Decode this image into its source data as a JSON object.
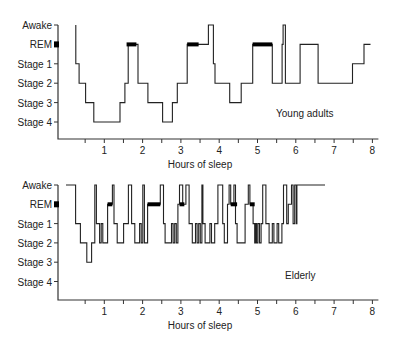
{
  "chart_data": [
    {
      "type": "line",
      "title": "Young adults",
      "xlabel": "Hours of sleep",
      "ylabel": "",
      "y_categories": [
        "Awake",
        "REM",
        "Stage 1",
        "Stage 2",
        "Stage 3",
        "Stage 4"
      ],
      "x_ticks": [
        1,
        2,
        3,
        4,
        5,
        6,
        7,
        8
      ],
      "xlim": [
        0,
        8
      ],
      "steps": [
        [
          0.0,
          0
        ],
        [
          0.3,
          0
        ],
        [
          0.3,
          2
        ],
        [
          0.4,
          2
        ],
        [
          0.4,
          3
        ],
        [
          0.6,
          3
        ],
        [
          0.6,
          4
        ],
        [
          0.85,
          4
        ],
        [
          0.85,
          5
        ],
        [
          1.6,
          5
        ],
        [
          1.6,
          4
        ],
        [
          1.75,
          4
        ],
        [
          1.75,
          3
        ],
        [
          1.8,
          3
        ],
        [
          1.8,
          1
        ],
        [
          2.05,
          1
        ],
        [
          2.05,
          3
        ],
        [
          2.35,
          3
        ],
        [
          2.35,
          4
        ],
        [
          2.9,
          4
        ],
        [
          2.9,
          5
        ],
        [
          2.9,
          5
        ],
        [
          2.9,
          5
        ],
        [
          3.1,
          5
        ]
      ],
      "segments_young": true
    },
    {
      "type": "line",
      "title": "Elderly",
      "xlabel": "Hours of sleep",
      "y_categories": [
        "Awake",
        "REM",
        "Stage 1",
        "Stage 2",
        "Stage 3",
        "Stage 4"
      ],
      "x_ticks": [
        1,
        2,
        3,
        4,
        5,
        6,
        7,
        8
      ],
      "xlim": [
        0,
        8
      ]
    }
  ],
  "young": {
    "label": "Young adults",
    "xlabel": "Hours of sleep",
    "ticks": [
      "1",
      "2",
      "3",
      "4",
      "5",
      "6",
      "7",
      "8"
    ],
    "y_labels": [
      "Awake",
      "REM",
      "Stage 1",
      "Stage 2",
      "Stage 3",
      "Stage 4"
    ],
    "steps": [
      [
        0.3,
        0
      ],
      [
        0.3,
        2
      ],
      [
        0.4,
        2
      ],
      [
        0.4,
        3
      ],
      [
        0.6,
        3
      ],
      [
        0.6,
        4
      ],
      [
        0.85,
        4
      ],
      [
        0.85,
        5
      ],
      [
        1.65,
        5
      ],
      [
        1.65,
        4
      ],
      [
        1.8,
        4
      ],
      [
        1.8,
        3
      ],
      [
        1.9,
        3
      ],
      [
        1.9,
        1
      ],
      [
        2.2,
        1
      ],
      [
        2.2,
        3
      ],
      [
        2.5,
        3
      ],
      [
        2.5,
        4
      ],
      [
        2.95,
        4
      ],
      [
        2.95,
        5
      ],
      [
        3.25,
        5
      ],
      [
        3.25,
        4
      ],
      [
        3.4,
        4
      ],
      [
        3.4,
        3
      ],
      [
        3.7,
        3
      ],
      [
        3.7,
        1
      ],
      [
        4.35,
        1
      ],
      [
        4.35,
        0
      ],
      [
        4.5,
        0
      ],
      [
        4.5,
        2
      ],
      [
        4.55,
        2
      ],
      [
        4.55,
        3
      ],
      [
        5.0,
        3
      ],
      [
        5.0,
        4
      ],
      [
        5.35,
        4
      ],
      [
        5.35,
        3
      ],
      [
        5.7,
        3
      ],
      [
        5.7,
        1
      ],
      [
        6.3,
        1
      ],
      [
        6.3,
        3
      ],
      [
        6.6,
        3
      ],
      [
        6.6,
        1
      ],
      [
        6.63,
        1
      ],
      [
        6.63,
        0
      ],
      [
        6.7,
        0
      ],
      [
        6.7,
        3
      ],
      [
        7.15,
        3
      ],
      [
        7.15,
        1
      ],
      [
        7.7,
        1
      ],
      [
        7.7,
        3
      ],
      [
        8.75,
        3
      ],
      [
        8.75,
        2
      ],
      [
        9.1,
        2
      ],
      [
        9.1,
        1
      ],
      [
        9.3,
        1
      ]
    ],
    "rem": [
      [
        -0.1,
        -0.05
      ],
      [
        1.85,
        2.15
      ],
      [
        3.7,
        4.05
      ],
      [
        5.7,
        6.3
      ]
    ]
  },
  "elderly": {
    "label": "Elderly",
    "xlabel": "Hours of sleep",
    "ticks": [
      "1",
      "2",
      "3",
      "4",
      "5",
      "6",
      "7",
      "8"
    ],
    "y_labels": [
      "Awake",
      "REM",
      "Stage 1",
      "Stage 2",
      "Stage 3",
      "Stage 4"
    ],
    "steps": [
      [
        0,
        0
      ],
      [
        0.3,
        0
      ],
      [
        0.3,
        2
      ],
      [
        0.45,
        2
      ],
      [
        0.45,
        3
      ],
      [
        0.65,
        3
      ],
      [
        0.65,
        4
      ],
      [
        0.8,
        4
      ],
      [
        0.8,
        3
      ],
      [
        0.9,
        3
      ],
      [
        0.9,
        0
      ],
      [
        0.95,
        0
      ],
      [
        0.95,
        2
      ],
      [
        1.05,
        2
      ],
      [
        1.05,
        3
      ],
      [
        1.1,
        3
      ],
      [
        1.1,
        2
      ],
      [
        1.15,
        2
      ],
      [
        1.15,
        3
      ],
      [
        1.3,
        3
      ],
      [
        1.3,
        1
      ],
      [
        1.45,
        1
      ],
      [
        1.45,
        0
      ],
      [
        1.5,
        0
      ],
      [
        1.5,
        2
      ],
      [
        1.6,
        2
      ],
      [
        1.6,
        3
      ],
      [
        1.8,
        3
      ],
      [
        1.8,
        2
      ],
      [
        1.95,
        2
      ],
      [
        1.95,
        0
      ],
      [
        2.05,
        0
      ],
      [
        2.05,
        2
      ],
      [
        2.15,
        2
      ],
      [
        2.15,
        3
      ],
      [
        2.3,
        3
      ],
      [
        2.3,
        2
      ],
      [
        2.35,
        2
      ],
      [
        2.35,
        3
      ],
      [
        2.4,
        3
      ],
      [
        2.4,
        0
      ],
      [
        2.45,
        0
      ],
      [
        2.45,
        3
      ],
      [
        2.55,
        3
      ],
      [
        2.55,
        1
      ],
      [
        2.95,
        1
      ],
      [
        2.95,
        0
      ],
      [
        3.05,
        0
      ],
      [
        3.05,
        2
      ],
      [
        3.1,
        2
      ],
      [
        3.1,
        3
      ],
      [
        3.3,
        3
      ],
      [
        3.3,
        2
      ],
      [
        3.35,
        2
      ],
      [
        3.35,
        3
      ],
      [
        3.4,
        3
      ],
      [
        3.4,
        2
      ],
      [
        3.45,
        2
      ],
      [
        3.45,
        3
      ],
      [
        3.5,
        3
      ],
      [
        3.5,
        1
      ],
      [
        3.55,
        1
      ],
      [
        3.55,
        0
      ],
      [
        3.65,
        0
      ],
      [
        3.65,
        1
      ],
      [
        3.75,
        1
      ],
      [
        3.75,
        0
      ],
      [
        3.85,
        0
      ],
      [
        3.85,
        2
      ],
      [
        3.95,
        2
      ],
      [
        3.95,
        3
      ],
      [
        4.05,
        3
      ],
      [
        4.05,
        2
      ],
      [
        4.1,
        2
      ],
      [
        4.1,
        3
      ],
      [
        4.15,
        3
      ],
      [
        4.15,
        2
      ],
      [
        4.2,
        2
      ],
      [
        4.2,
        3
      ],
      [
        4.25,
        3
      ],
      [
        4.25,
        0
      ],
      [
        4.28,
        0
      ],
      [
        4.28,
        2
      ],
      [
        4.35,
        2
      ],
      [
        4.35,
        3
      ],
      [
        4.5,
        3
      ],
      [
        4.5,
        2
      ],
      [
        4.55,
        2
      ],
      [
        4.55,
        3
      ],
      [
        4.65,
        3
      ],
      [
        4.65,
        2
      ],
      [
        4.75,
        2
      ],
      [
        4.75,
        0
      ],
      [
        4.9,
        0
      ],
      [
        4.9,
        2
      ],
      [
        4.95,
        2
      ],
      [
        4.95,
        3
      ],
      [
        5.05,
        3
      ],
      [
        5.05,
        1
      ],
      [
        5.1,
        1
      ],
      [
        5.1,
        0
      ],
      [
        5.15,
        0
      ],
      [
        5.15,
        1
      ],
      [
        5.25,
        1
      ],
      [
        5.25,
        0
      ],
      [
        5.3,
        0
      ],
      [
        5.3,
        2
      ],
      [
        5.35,
        2
      ],
      [
        5.35,
        3
      ],
      [
        5.6,
        3
      ],
      [
        5.6,
        1
      ],
      [
        5.7,
        1
      ],
      [
        5.7,
        0
      ],
      [
        5.75,
        0
      ],
      [
        5.75,
        1
      ],
      [
        5.85,
        1
      ],
      [
        5.85,
        2
      ],
      [
        5.9,
        2
      ],
      [
        5.9,
        3
      ],
      [
        5.93,
        3
      ],
      [
        5.93,
        2
      ],
      [
        5.96,
        2
      ],
      [
        5.96,
        3
      ],
      [
        6.0,
        3
      ],
      [
        6.0,
        2
      ],
      [
        6.05,
        2
      ],
      [
        6.05,
        3
      ],
      [
        6.1,
        3
      ],
      [
        6.1,
        2
      ],
      [
        6.15,
        2
      ],
      [
        6.15,
        0
      ],
      [
        6.25,
        0
      ],
      [
        6.25,
        2
      ],
      [
        6.35,
        2
      ],
      [
        6.35,
        3
      ],
      [
        6.45,
        3
      ],
      [
        6.45,
        2
      ],
      [
        6.5,
        2
      ],
      [
        6.5,
        3
      ],
      [
        6.6,
        3
      ],
      [
        6.6,
        2
      ],
      [
        6.65,
        2
      ],
      [
        6.65,
        3
      ],
      [
        6.75,
        3
      ],
      [
        6.75,
        2
      ],
      [
        6.8,
        2
      ],
      [
        6.8,
        0
      ],
      [
        6.9,
        0
      ],
      [
        6.9,
        2
      ],
      [
        6.95,
        2
      ],
      [
        6.95,
        1
      ],
      [
        7.05,
        1
      ],
      [
        7.05,
        0
      ],
      [
        7.1,
        0
      ],
      [
        7.1,
        2
      ],
      [
        7.15,
        2
      ],
      [
        7.15,
        0
      ],
      [
        7.2,
        0
      ],
      [
        7.2,
        2
      ],
      [
        7.22,
        2
      ],
      [
        7.22,
        0
      ],
      [
        8.1,
        0
      ]
    ],
    "rem": [
      [
        -0.1,
        -0.05
      ],
      [
        1.3,
        1.45
      ],
      [
        2.55,
        2.95
      ],
      [
        3.55,
        3.7
      ],
      [
        5.15,
        5.35
      ],
      [
        5.75,
        5.9
      ]
    ]
  }
}
